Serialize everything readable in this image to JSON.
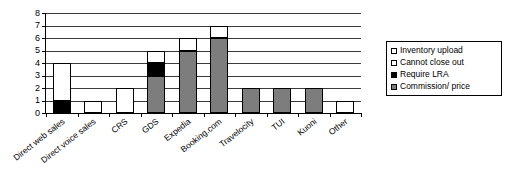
{
  "chart_data": {
    "type": "bar",
    "stacked": true,
    "title": "",
    "subtitle": "",
    "xlabel": "",
    "ylabel": "",
    "ylim": [
      0,
      8
    ],
    "ytick_labels": [
      "0",
      "1",
      "2",
      "3",
      "4",
      "5",
      "6",
      "7",
      "8"
    ],
    "ytick_values": [
      0,
      1,
      2,
      3,
      4,
      5,
      6,
      7,
      8
    ],
    "grid": true,
    "grid_axis": "y",
    "legend_position": "right",
    "categories": [
      "Direct web sales",
      "Direct voice sales",
      "CRS",
      "GDS",
      "Expedia",
      "Booking.com",
      "Travelocity",
      "TUI",
      "Kuoni",
      "Other"
    ],
    "series": [
      {
        "name": "Inventory upload",
        "color": "#ffffff",
        "values": [
          0,
          0,
          0,
          0,
          0,
          0,
          0,
          0,
          0,
          0
        ]
      },
      {
        "name": "Cannot close out",
        "color": "#ffffff",
        "values": [
          3,
          1,
          2,
          1,
          1,
          1,
          0,
          0,
          0,
          1
        ]
      },
      {
        "name": "Require LRA",
        "color": "#000000",
        "values": [
          1,
          0,
          0,
          1,
          0,
          0,
          0,
          0,
          0,
          0
        ]
      },
      {
        "name": "Commission/ price",
        "color": "#7d7d7d",
        "values": [
          0,
          0,
          0,
          3,
          5,
          6,
          2,
          2,
          2,
          0
        ]
      }
    ],
    "totals": [
      4,
      1,
      2,
      5,
      6,
      7,
      2,
      2,
      2,
      1
    ]
  },
  "axis": {
    "y_ticks": [
      "8",
      "7",
      "6",
      "5",
      "4",
      "3",
      "2",
      "1",
      "0"
    ]
  },
  "legend": {
    "items": [
      {
        "label": "Inventory upload",
        "swatch": "white"
      },
      {
        "label": "Cannot close out",
        "swatch": "white"
      },
      {
        "label": "Require LRA",
        "swatch": "black"
      },
      {
        "label": "Commission/ price",
        "swatch": "gray"
      }
    ]
  }
}
